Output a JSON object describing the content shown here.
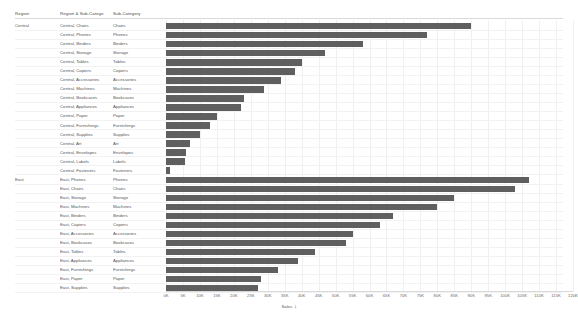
{
  "columns": {
    "region": "Region",
    "region_subcategory": "Region & Sub-Catego",
    "subcategory": "Sub-Category"
  },
  "axis": {
    "title": "Sales",
    "sort_icon": "sort-descending-icon",
    "ticks": [
      "0K",
      "5K",
      "10K",
      "15K",
      "20K",
      "25K",
      "30K",
      "35K",
      "40K",
      "45K",
      "50K",
      "55K",
      "60K",
      "65K",
      "70K",
      "75K",
      "80K",
      "85K",
      "90K",
      "95K",
      "100K",
      "105K",
      "110K",
      "115K",
      "120K"
    ],
    "min": 0,
    "max": 120000
  },
  "colors": {
    "bar": "#5f5f5f",
    "gridline": "#f0f0f0",
    "text": "#555555"
  },
  "regions": [
    {
      "name": "Central"
    },
    {
      "name": "East"
    }
  ],
  "chart_data": {
    "type": "bar",
    "orientation": "horizontal",
    "title": "",
    "xlabel": "Sales",
    "ylabel": "Region & Sub-Category",
    "xlim": [
      0,
      120000
    ],
    "grid": true,
    "legend": "none",
    "categories": [
      "Central, Chairs",
      "Central, Phones",
      "Central, Binders",
      "Central, Storage",
      "Central, Tables",
      "Central, Copiers",
      "Central, Accessories",
      "Central, Machines",
      "Central, Bookcases",
      "Central, Appliances",
      "Central, Paper",
      "Central, Furnishings",
      "Central, Supplies",
      "Central, Art",
      "Central, Envelopes",
      "Central, Labels",
      "Central, Fasteners",
      "East, Phones",
      "East, Chairs",
      "East, Storage",
      "East, Machines",
      "East, Binders",
      "East, Copiers",
      "East, Accessories",
      "East, Bookcases",
      "East, Tables",
      "East, Appliances",
      "East, Furnishings",
      "East, Paper",
      "East, Supplies"
    ],
    "values": [
      90000,
      77000,
      58000,
      47000,
      40000,
      38000,
      34000,
      29000,
      23000,
      22000,
      15000,
      13000,
      10000,
      7000,
      6000,
      5500,
      1200,
      107000,
      103000,
      85000,
      80000,
      67000,
      63000,
      55000,
      53000,
      44000,
      39000,
      33000,
      28000,
      27000
    ]
  },
  "rows": [
    {
      "region": "Central",
      "region_sub": "Central, Chairs",
      "sub": "Chairs",
      "value": 90000
    },
    {
      "region": "Central",
      "region_sub": "Central, Phones",
      "sub": "Phones",
      "value": 77000
    },
    {
      "region": "Central",
      "region_sub": "Central, Binders",
      "sub": "Binders",
      "value": 58000
    },
    {
      "region": "Central",
      "region_sub": "Central, Storage",
      "sub": "Storage",
      "value": 47000
    },
    {
      "region": "Central",
      "region_sub": "Central, Tables",
      "sub": "Tables",
      "value": 40000
    },
    {
      "region": "Central",
      "region_sub": "Central, Copiers",
      "sub": "Copiers",
      "value": 38000
    },
    {
      "region": "Central",
      "region_sub": "Central, Accessories",
      "sub": "Accessories",
      "value": 34000
    },
    {
      "region": "Central",
      "region_sub": "Central, Machines",
      "sub": "Machines",
      "value": 29000
    },
    {
      "region": "Central",
      "region_sub": "Central, Bookcases",
      "sub": "Bookcases",
      "value": 23000
    },
    {
      "region": "Central",
      "region_sub": "Central, Appliances",
      "sub": "Appliances",
      "value": 22000
    },
    {
      "region": "Central",
      "region_sub": "Central, Paper",
      "sub": "Paper",
      "value": 15000
    },
    {
      "region": "Central",
      "region_sub": "Central, Furnishings",
      "sub": "Furnishings",
      "value": 13000
    },
    {
      "region": "Central",
      "region_sub": "Central, Supplies",
      "sub": "Supplies",
      "value": 10000
    },
    {
      "region": "Central",
      "region_sub": "Central, Art",
      "sub": "Art",
      "value": 7000
    },
    {
      "region": "Central",
      "region_sub": "Central, Envelopes",
      "sub": "Envelopes",
      "value": 6000
    },
    {
      "region": "Central",
      "region_sub": "Central, Labels",
      "sub": "Labels",
      "value": 5500
    },
    {
      "region": "Central",
      "region_sub": "Central, Fasteners",
      "sub": "Fasteners",
      "value": 1200
    },
    {
      "region": "East",
      "region_sub": "East, Phones",
      "sub": "Phones",
      "value": 107000
    },
    {
      "region": "East",
      "region_sub": "East, Chairs",
      "sub": "Chairs",
      "value": 103000
    },
    {
      "region": "East",
      "region_sub": "East, Storage",
      "sub": "Storage",
      "value": 85000
    },
    {
      "region": "East",
      "region_sub": "East, Machines",
      "sub": "Machines",
      "value": 80000
    },
    {
      "region": "East",
      "region_sub": "East, Binders",
      "sub": "Binders",
      "value": 67000
    },
    {
      "region": "East",
      "region_sub": "East, Copiers",
      "sub": "Copiers",
      "value": 63000
    },
    {
      "region": "East",
      "region_sub": "East, Accessories",
      "sub": "Accessories",
      "value": 55000
    },
    {
      "region": "East",
      "region_sub": "East, Bookcases",
      "sub": "Bookcases",
      "value": 53000
    },
    {
      "region": "East",
      "region_sub": "East, Tables",
      "sub": "Tables",
      "value": 44000
    },
    {
      "region": "East",
      "region_sub": "East, Appliances",
      "sub": "Appliances",
      "value": 39000
    },
    {
      "region": "East",
      "region_sub": "East, Furnishings",
      "sub": "Furnishings",
      "value": 33000
    },
    {
      "region": "East",
      "region_sub": "East, Paper",
      "sub": "Paper",
      "value": 28000
    },
    {
      "region": "East",
      "region_sub": "East, Supplies",
      "sub": "Supplies",
      "value": 27000
    }
  ]
}
